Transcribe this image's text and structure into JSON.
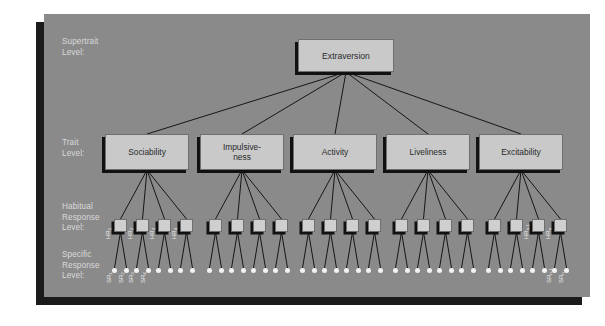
{
  "diagram": {
    "background_color": "#8a8a8a",
    "box_fill_color": "#c9c9c9",
    "shadow_color": "#111111",
    "dot_color": "#f2f2f2",
    "label_color": "#d9d9d9"
  },
  "row_labels": [
    {
      "id": "supertrait",
      "text": "Supertrait\nLevel:"
    },
    {
      "id": "trait",
      "text": "Trait\nLevel:"
    },
    {
      "id": "habitual",
      "text": "Habitual\nResponse\nLevel:"
    },
    {
      "id": "specific",
      "text": "Specific\nResponse\nLevel:"
    }
  ],
  "supertrait": {
    "label": "Extraversion"
  },
  "traits": [
    {
      "id": "sociability",
      "label": "Sociability"
    },
    {
      "id": "impulsiveness",
      "label": "Impulsive-\nness"
    },
    {
      "id": "activity",
      "label": "Activity"
    },
    {
      "id": "liveliness",
      "label": "Liveliness"
    },
    {
      "id": "excitability",
      "label": "Excitability"
    }
  ],
  "habitual_responses": {
    "count_per_trait": 4,
    "total": 20,
    "labeled": [
      {
        "index": 0,
        "base": "HR",
        "sub": "1"
      },
      {
        "index": 1,
        "base": "HR",
        "sub": "2"
      },
      {
        "index": 2,
        "base": "HR",
        "sub": "3"
      },
      {
        "index": 3,
        "base": "HR",
        "sub": "4"
      },
      {
        "index": 18,
        "base": "HR",
        "sub": "n-1"
      },
      {
        "index": 19,
        "base": "HR",
        "sub": "n"
      }
    ]
  },
  "specific_responses": {
    "count_per_habitual": 2,
    "total": 40,
    "labeled": [
      {
        "index": 0,
        "base": "SR",
        "sub": "1"
      },
      {
        "index": 1,
        "base": "SR",
        "sub": "2"
      },
      {
        "index": 2,
        "base": "SR",
        "sub": "3"
      },
      {
        "index": 3,
        "base": "SR",
        "sub": "4"
      },
      {
        "index": 38,
        "base": "SR",
        "sub": "n-1"
      },
      {
        "index": 39,
        "base": "SR",
        "sub": "n"
      }
    ]
  }
}
